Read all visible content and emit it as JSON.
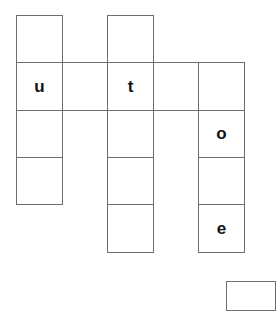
{
  "puzzle": {
    "type": "crossword",
    "cell_size": 46,
    "col_edges": [
      16,
      62,
      107,
      153,
      198,
      244
    ],
    "row_edges": [
      15,
      62,
      110,
      157,
      204,
      252
    ],
    "border_color": "#6e6e6e",
    "letter_color": "#111111",
    "cells": [
      {
        "id": "c0r0",
        "col": 0,
        "row": 0,
        "letter": ""
      },
      {
        "id": "c0r1",
        "col": 0,
        "row": 1,
        "letter": "u"
      },
      {
        "id": "c0r2",
        "col": 0,
        "row": 2,
        "letter": ""
      },
      {
        "id": "c0r3",
        "col": 0,
        "row": 3,
        "letter": ""
      },
      {
        "id": "c1r1",
        "col": 1,
        "row": 1,
        "letter": ""
      },
      {
        "id": "c2r0",
        "col": 2,
        "row": 0,
        "letter": ""
      },
      {
        "id": "c2r1",
        "col": 2,
        "row": 1,
        "letter": "t"
      },
      {
        "id": "c2r2",
        "col": 2,
        "row": 2,
        "letter": ""
      },
      {
        "id": "c2r3",
        "col": 2,
        "row": 3,
        "letter": ""
      },
      {
        "id": "c2r4",
        "col": 2,
        "row": 4,
        "letter": ""
      },
      {
        "id": "c3r1",
        "col": 3,
        "row": 1,
        "letter": ""
      },
      {
        "id": "c4r1",
        "col": 4,
        "row": 1,
        "letter": ""
      },
      {
        "id": "c4r2",
        "col": 4,
        "row": 2,
        "letter": "o"
      },
      {
        "id": "c4r3",
        "col": 4,
        "row": 3,
        "letter": ""
      },
      {
        "id": "c4r4",
        "col": 4,
        "row": 4,
        "letter": "e"
      }
    ]
  }
}
